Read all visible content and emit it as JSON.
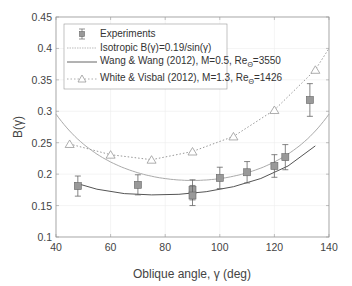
{
  "chart_data": {
    "type": "scatter",
    "title": "",
    "xlabel": "Oblique angle, γ (deg)",
    "ylabel": "B(γ)",
    "xlim": [
      40,
      140
    ],
    "ylim": [
      0.1,
      0.45
    ],
    "xticks": [
      40,
      60,
      80,
      100,
      120,
      140
    ],
    "yticks": [
      0.1,
      0.15,
      0.2,
      0.25,
      0.3,
      0.35,
      0.4,
      0.45
    ],
    "grid": true,
    "legend_position": "upper left",
    "series": [
      {
        "name": "Experiments",
        "kind": "scatter-errorbar",
        "marker": "square",
        "color": "#888888",
        "x": [
          48,
          70,
          90,
          90,
          100,
          110,
          120,
          124,
          133
        ],
        "y": [
          0.181,
          0.183,
          0.175,
          0.166,
          0.194,
          0.203,
          0.213,
          0.227,
          0.318
        ],
        "err": [
          0.016,
          0.016,
          0.016,
          0.016,
          0.017,
          0.017,
          0.018,
          0.02,
          0.026
        ]
      },
      {
        "name": "Isotropic B(γ)=0.19/sin(γ)",
        "kind": "line",
        "style": "solid-light",
        "color": "#aaaaaa",
        "formula": "0.19/sin(gamma)",
        "x": [
          40,
          50,
          60,
          70,
          80,
          90,
          100,
          110,
          120,
          130,
          140
        ],
        "y": [
          0.296,
          0.248,
          0.219,
          0.202,
          0.193,
          0.19,
          0.193,
          0.202,
          0.219,
          0.248,
          0.296
        ]
      },
      {
        "name": "Wang & Wang (2012), M=0.5, Re_Θ=3550",
        "kind": "line",
        "style": "solid",
        "color": "#555555",
        "x": [
          47,
          55,
          65,
          75,
          85,
          95,
          105,
          115,
          125,
          135
        ],
        "y": [
          0.186,
          0.176,
          0.169,
          0.167,
          0.168,
          0.172,
          0.18,
          0.193,
          0.213,
          0.245
        ]
      },
      {
        "name": "White & Visbal (2012), M=1.3, Re_Θ=1426",
        "kind": "line-marker",
        "style": "dotted",
        "marker": "triangle",
        "color": "#999999",
        "x": [
          45,
          60,
          75,
          90,
          105,
          120,
          135
        ],
        "y": [
          0.248,
          0.231,
          0.223,
          0.236,
          0.26,
          0.302,
          0.366
        ]
      }
    ]
  },
  "axes": {
    "xlabel": "Oblique angle, γ (deg)",
    "ylabel": "B(γ)",
    "xtick_labels": [
      "40",
      "60",
      "80",
      "100",
      "120",
      "140"
    ],
    "ytick_labels": [
      "0.1",
      "0.15",
      "0.2",
      "0.25",
      "0.3",
      "0.35",
      "0.4",
      "0.45"
    ]
  },
  "legend": {
    "items": [
      {
        "label": "Experiments"
      },
      {
        "label": "Isotropic B(γ)=0.19/sin(γ)"
      },
      {
        "label_main": "Wang & Wang (2012), M=0.5, Re",
        "sub": "Θ",
        "tail": "=3550"
      },
      {
        "label_main": "White & Visbal (2012), M=1.3, Re",
        "sub": "Θ",
        "tail": "=1426"
      }
    ]
  }
}
